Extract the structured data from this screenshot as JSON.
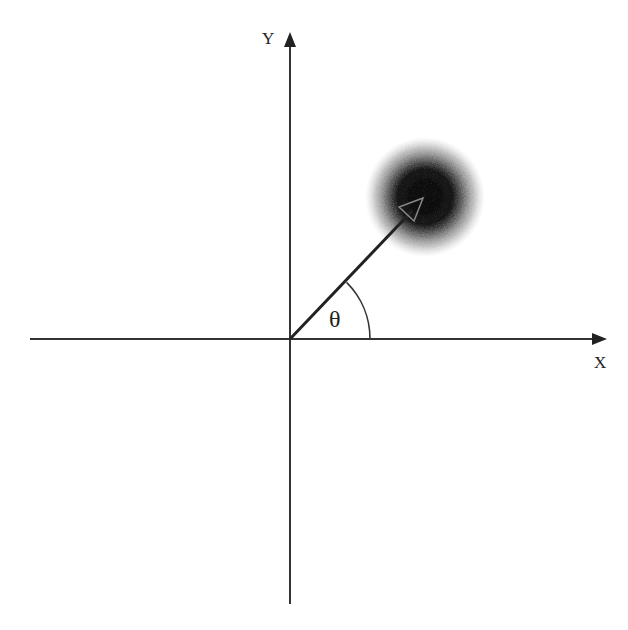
{
  "diagram": {
    "axes": {
      "x_label": "X",
      "y_label": "Y",
      "origin": [
        290,
        339
      ],
      "x_range_px": [
        30,
        607
      ],
      "y_range_px": [
        32,
        604
      ]
    },
    "vector": {
      "from": [
        290,
        339
      ],
      "to": [
        422,
        200
      ]
    },
    "angle": {
      "symbol": "θ",
      "arc_radius": 80
    },
    "blob": {
      "center": [
        425,
        197
      ],
      "outer_radius": 58,
      "inner_radius": 30
    },
    "colors": {
      "axis": "#333333",
      "text": "#222222",
      "blob_core": "#111111"
    }
  }
}
